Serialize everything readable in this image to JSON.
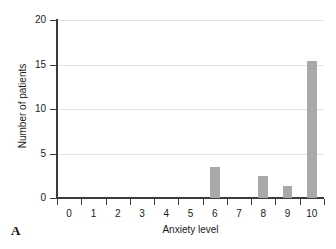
{
  "figure": {
    "panel_label": "A",
    "background_color": "#ffffff"
  },
  "chart_data": {
    "type": "bar",
    "title": "",
    "xlabel": "Anxiety level",
    "ylabel": "Number of patients",
    "categories": [
      "0",
      "1",
      "2",
      "3",
      "4",
      "5",
      "6",
      "7",
      "8",
      "9",
      "10"
    ],
    "values": [
      0,
      0,
      0,
      0,
      0,
      0,
      3.5,
      0,
      2.5,
      1.3,
      15.4
    ],
    "xlim": [
      -0.5,
      10.5
    ],
    "ylim": [
      0,
      20
    ],
    "yticks": [
      0,
      5,
      10,
      15,
      20
    ],
    "ytick_labels": [
      "0",
      "5",
      "10",
      "15",
      "20"
    ],
    "xtick_labels": [
      "0",
      "1",
      "2",
      "3",
      "4",
      "5",
      "6",
      "7",
      "8",
      "9",
      "10"
    ],
    "grid": "horizontal",
    "legend": "none",
    "bar_color": "#a9a9a9",
    "axis_color": "#3b3b3b",
    "grid_color": "#e2e2e2"
  }
}
